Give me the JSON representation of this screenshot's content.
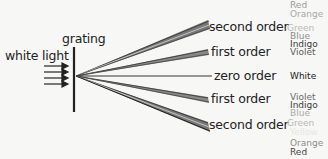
{
  "labels": {
    "grating": "grating",
    "input": "white light"
  },
  "orders": [
    {
      "id": "second-order-top",
      "label": "second order",
      "y": 27
    },
    {
      "id": "first-order-top",
      "label": "first order",
      "y": 53
    },
    {
      "id": "zero-order",
      "label": "zero order",
      "y": 76
    },
    {
      "id": "first-order-bottom",
      "label": "first order",
      "y": 99
    },
    {
      "id": "second-order-bottom",
      "label": "second order",
      "y": 125
    }
  ],
  "spectra": {
    "top": [
      {
        "name": "Red",
        "color": "#9a9a9a"
      },
      {
        "name": "Orange",
        "color": "#a8a8a8"
      },
      {
        "name": "Green",
        "color": "#b8b8b8"
      },
      {
        "name": "Blue",
        "color": "#8c8c8c"
      },
      {
        "name": "Indigo",
        "color": "#3a3a3a"
      },
      {
        "name": "Violet",
        "color": "#5a5a5a"
      }
    ],
    "zero": [
      {
        "name": "White",
        "color": "#222222"
      }
    ],
    "bottom": [
      {
        "name": "Violet",
        "color": "#6a6a6a"
      },
      {
        "name": "Indigo",
        "color": "#3a3a3a"
      },
      {
        "name": "Blue",
        "color": "#a8a8a8"
      },
      {
        "name": "Green",
        "color": "#b8b8b8"
      },
      {
        "name": "Yellow",
        "color": "#e6e6e6"
      },
      {
        "name": "Orange",
        "color": "#8c8c8c"
      },
      {
        "name": "Red",
        "color": "#444444"
      }
    ]
  }
}
